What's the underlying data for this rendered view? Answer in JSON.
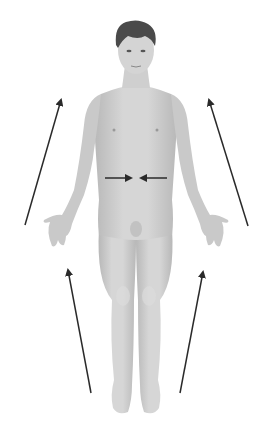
{
  "figure": {
    "background": "#ffffff",
    "colors": {
      "skin": "#cfcfcf",
      "skin_shadow": "#b3b3b3",
      "skin_highlight": "#e2e2e2",
      "hair": "#4a4a4a",
      "arrow": "#2a2a2a"
    },
    "arrows": [
      {
        "id": "upper-left-arrow",
        "from": [
          25,
          225
        ],
        "to": [
          61,
          100
        ],
        "direction": "up"
      },
      {
        "id": "upper-right-arrow",
        "from": [
          248,
          226
        ],
        "to": [
          209,
          100
        ],
        "direction": "up"
      },
      {
        "id": "lower-left-arrow",
        "from": [
          91,
          393
        ],
        "to": [
          68,
          270
        ],
        "direction": "up"
      },
      {
        "id": "lower-right-arrow",
        "from": [
          180,
          393
        ],
        "to": [
          203,
          272
        ],
        "direction": "up"
      },
      {
        "id": "midline-arrow-left",
        "from": [
          105,
          178
        ],
        "to": [
          131,
          178
        ],
        "direction": "right"
      },
      {
        "id": "midline-arrow-right",
        "from": [
          167,
          178
        ],
        "to": [
          141,
          178
        ],
        "direction": "left"
      }
    ],
    "labels": []
  }
}
